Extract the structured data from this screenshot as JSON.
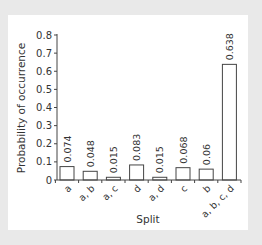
{
  "chart_data": {
    "type": "bar",
    "title": "",
    "xlabel": "Split",
    "ylabel": "Probability of occurrence",
    "categories": [
      "a",
      "a, b",
      "a, c",
      "d",
      "a, d",
      "c",
      "b",
      "a, b, c, d"
    ],
    "values": [
      0.074,
      0.048,
      0.015,
      0.083,
      0.015,
      0.068,
      0.06,
      0.638
    ],
    "value_labels": [
      "0.074",
      "0.048",
      "0.015",
      "0.083",
      "0.015",
      "0.068",
      "0.06",
      "0.638"
    ],
    "ylim": [
      0,
      0.8
    ],
    "yticks": [
      "0",
      "0.1",
      "0.2",
      "0.3",
      "0.4",
      "0.5",
      "0.6",
      "0.7",
      "0.8"
    ],
    "grid": false,
    "legend": null,
    "bar_fill": "#ffffff",
    "bar_stroke": "#444444"
  }
}
